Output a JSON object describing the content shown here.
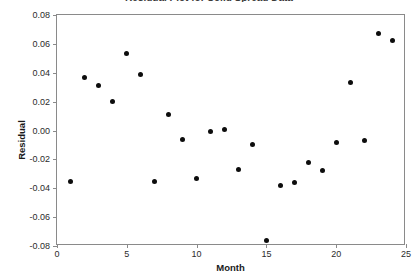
{
  "chart_data": {
    "type": "scatter",
    "title": "Residual Plot for Solid Spread Data",
    "xlabel": "Month",
    "ylabel": "Residual",
    "xlim": [
      0,
      25
    ],
    "ylim": [
      -0.08,
      0.08
    ],
    "xticks": [
      "0",
      "5",
      "10",
      "15",
      "20",
      "25"
    ],
    "xtick_values": [
      0,
      5,
      10,
      15,
      20,
      25
    ],
    "yticks": [
      "0.08",
      "0.06",
      "0.04",
      "0.02",
      "0.00",
      "-0.02",
      "-0.04",
      "-0.06",
      "-0.08"
    ],
    "ytick_values": [
      0.08,
      0.06,
      0.04,
      0.02,
      0.0,
      -0.02,
      -0.04,
      -0.06,
      -0.08
    ],
    "grid": false,
    "legend": false,
    "marker_color": "#0d0d0d",
    "frame_color": "#8a8a8a",
    "background": "#ffffff",
    "x": [
      1,
      2,
      3,
      4,
      5,
      6,
      7,
      8,
      9,
      10,
      11,
      12,
      13,
      14,
      15,
      16,
      17,
      18,
      19,
      20,
      21,
      22,
      23,
      24
    ],
    "y": [
      -0.035,
      0.037,
      0.031,
      0.02,
      0.053,
      0.039,
      -0.035,
      0.011,
      -0.006,
      -0.033,
      -0.001,
      0.001,
      -0.027,
      -0.01,
      -0.076,
      -0.038,
      -0.036,
      -0.022,
      -0.028,
      -0.008,
      0.033,
      -0.007,
      0.067,
      0.062
    ],
    "points": [
      {
        "month": 1,
        "residual": -0.035
      },
      {
        "month": 2,
        "residual": 0.037
      },
      {
        "month": 3,
        "residual": 0.031
      },
      {
        "month": 4,
        "residual": 0.02
      },
      {
        "month": 5,
        "residual": 0.053
      },
      {
        "month": 6,
        "residual": 0.039
      },
      {
        "month": 7,
        "residual": -0.035
      },
      {
        "month": 8,
        "residual": 0.011
      },
      {
        "month": 9,
        "residual": -0.006
      },
      {
        "month": 10,
        "residual": -0.033
      },
      {
        "month": 11,
        "residual": -0.001
      },
      {
        "month": 12,
        "residual": 0.001
      },
      {
        "month": 13,
        "residual": -0.027
      },
      {
        "month": 14,
        "residual": -0.01
      },
      {
        "month": 15,
        "residual": -0.076
      },
      {
        "month": 16,
        "residual": -0.038
      },
      {
        "month": 17,
        "residual": -0.036
      },
      {
        "month": 18,
        "residual": -0.022
      },
      {
        "month": 19,
        "residual": -0.028
      },
      {
        "month": 20,
        "residual": -0.008
      },
      {
        "month": 21,
        "residual": 0.033
      },
      {
        "month": 22,
        "residual": -0.007
      },
      {
        "month": 23,
        "residual": 0.067
      },
      {
        "month": 24,
        "residual": 0.062
      }
    ]
  }
}
